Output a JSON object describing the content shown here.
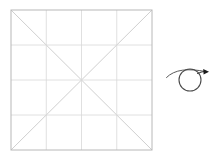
{
  "canvas": {
    "width": 222,
    "height": 163,
    "background_color": "#ffffff"
  },
  "grid_figure": {
    "name": "square-grid-with-diagonals",
    "x": 11,
    "y": 10,
    "width": 141,
    "height": 140,
    "rows": 4,
    "columns": 4,
    "border_color": "#b8b8b8",
    "border_width": 1,
    "grid_line_color": "#d8d8d8",
    "grid_line_width": 0.8,
    "diagonal_color": "#c9c9c9",
    "diagonal_width": 0.9,
    "diagonals": [
      {
        "name": "diagonal-tl-br",
        "x1": 11,
        "y1": 10,
        "x2": 152,
        "y2": 150
      },
      {
        "name": "diagonal-tr-bl",
        "x1": 152,
        "y1": 10,
        "x2": 11,
        "y2": 150
      }
    ],
    "vertical_lines_x": [
      46.25,
      81.5,
      116.75
    ],
    "horizontal_lines_y": [
      45,
      80,
      115
    ]
  },
  "gesture_annotation": {
    "name": "loop-arrow-gesture",
    "stroke_color": "#4a4a4a",
    "stroke_width": 1.1,
    "arrowhead_color": "#1a1a1a",
    "loop_center_x": 190,
    "loop_center_y": 80,
    "loop_radius_x": 11,
    "loop_radius_y": 11,
    "tail_start_x": 167,
    "tail_start_y": 75,
    "arrow_tip_x": 209,
    "arrow_tip_y": 72,
    "path": "M 167.5 76.5 C 172 72.5 179 69.5 186 69.2 C 194 68.9 200 70.2 206 71.6"
  }
}
